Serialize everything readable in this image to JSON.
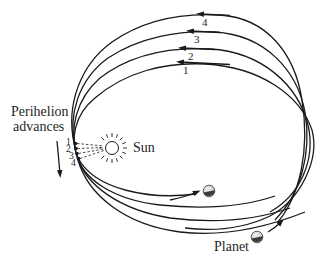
{
  "diagram": {
    "labels": {
      "perihelion_line1": "Perihelion",
      "perihelion_line2": "advances",
      "sun": "Sun",
      "planet": "Planet"
    },
    "orbits": [
      {
        "id": "1",
        "label": "1",
        "perihelion_label": "1"
      },
      {
        "id": "2",
        "label": "2",
        "perihelion_label": "2"
      },
      {
        "id": "3",
        "label": "3",
        "perihelion_label": "3"
      },
      {
        "id": "4",
        "label": "4",
        "perihelion_label": "4"
      }
    ],
    "icons": {
      "sun": "sun-icon",
      "planet": "planet-icon",
      "advance_arrow": "arrow-down-icon"
    },
    "colors": {
      "stroke": "#1a1a1a",
      "background": "#ffffff",
      "planet_dark": "#3a3a3a",
      "planet_light": "#d9d9d9"
    }
  }
}
